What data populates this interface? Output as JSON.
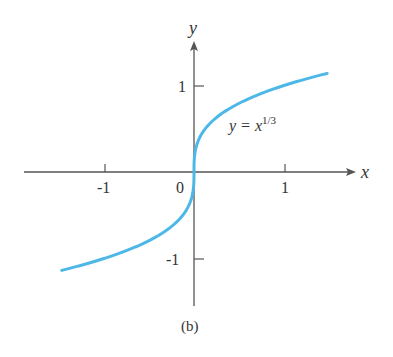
{
  "chart_data": {
    "type": "line",
    "title": "",
    "caption": "(b)",
    "xlabel": "x",
    "ylabel": "y",
    "curve_label": "y = x^{1/3}",
    "curve_label_base": "y = x",
    "curve_label_exp": "1/3",
    "series": [
      {
        "name": "y = x^(1/3)",
        "color": "#4db8e8",
        "x": [
          -1.47,
          -1.0,
          -0.5,
          -0.2,
          -0.05,
          0,
          0.05,
          0.2,
          0.5,
          1.0,
          1.48
        ],
        "y": [
          -1.14,
          -1.0,
          -0.79,
          -0.58,
          -0.37,
          0,
          0.37,
          0.58,
          0.79,
          1.0,
          1.14
        ]
      }
    ],
    "xticks": [
      "-1",
      "0",
      "1"
    ],
    "yticks": [
      "1",
      "-1"
    ],
    "xlim": [
      -1.9,
      1.8
    ],
    "ylim": [
      -1.55,
      1.55
    ],
    "grid": false,
    "legend": "none"
  }
}
